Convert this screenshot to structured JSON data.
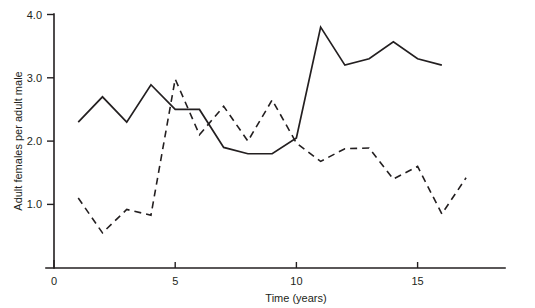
{
  "chart_data": {
    "type": "line",
    "title": "",
    "xlabel": "Time (years)",
    "ylabel": "Adult females per adult male",
    "xlim": [
      0,
      18.5
    ],
    "ylim": [
      0,
      4.0
    ],
    "grid": false,
    "legend": "none",
    "xticks": [
      "0",
      "5",
      "10",
      "15"
    ],
    "xtick_values": [
      0,
      5,
      10,
      15
    ],
    "yticks": [
      "1.0",
      "2.0",
      "3.0",
      "4.0"
    ],
    "ytick_values": [
      1.0,
      2.0,
      3.0,
      4.0
    ],
    "series": [
      {
        "name": "solid-series",
        "style": "solid",
        "color": "#231f20",
        "x": [
          1,
          2,
          3,
          4,
          5,
          6,
          7,
          8,
          9,
          10,
          11,
          12,
          13,
          14,
          15,
          16
        ],
        "values": [
          2.3,
          2.7,
          2.3,
          2.89,
          2.5,
          2.5,
          1.9,
          1.8,
          1.8,
          2.05,
          3.8,
          3.2,
          3.3,
          3.57,
          3.3,
          3.2
        ]
      },
      {
        "name": "dashed-series",
        "style": "dashed",
        "color": "#231f20",
        "x": [
          1,
          2,
          3,
          4,
          5,
          6,
          7,
          8,
          9,
          10,
          11,
          12,
          13,
          14,
          15,
          16,
          17
        ],
        "values": [
          1.1,
          0.55,
          0.92,
          0.83,
          2.98,
          2.1,
          2.55,
          2.0,
          2.65,
          1.97,
          1.68,
          1.88,
          1.89,
          1.4,
          1.6,
          0.85,
          1.42
        ]
      }
    ]
  }
}
